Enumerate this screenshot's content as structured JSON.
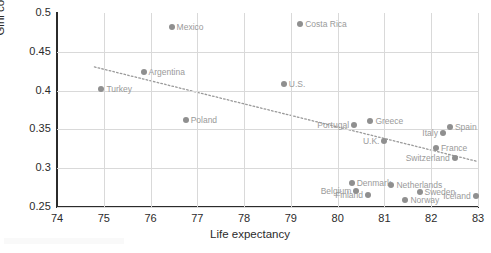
{
  "chart_data": {
    "type": "scatter",
    "title": "",
    "xlabel": "Life expectancy",
    "ylabel": "Gini coefficient",
    "xlim": [
      74,
      83
    ],
    "ylim": [
      0.25,
      0.5
    ],
    "xticks": [
      "74",
      "75",
      "76",
      "77",
      "78",
      "79",
      "80",
      "81",
      "82",
      "83"
    ],
    "yticks": [
      "0.25",
      "0.3",
      "0.35",
      "0.4",
      "0.45",
      "0.5"
    ],
    "grid": true,
    "legend": "none",
    "marker_color": "#8f8f8f",
    "label_color": "#9a9a9a",
    "axis_color": "#2b2b2b",
    "trendline": {
      "style": "dotted",
      "color": "#9a9a9a",
      "x_start": 74.8,
      "y_start": 0.4305,
      "x_end": 83.0,
      "y_end": 0.3085
    },
    "points": [
      {
        "name": "Turkey",
        "x": 74.95,
        "y": 0.4015,
        "label_side": "right"
      },
      {
        "name": "Argentina",
        "x": 75.85,
        "y": 0.4245,
        "label_side": "right"
      },
      {
        "name": "Mexico",
        "x": 76.45,
        "y": 0.4815,
        "label_side": "right"
      },
      {
        "name": "Poland",
        "x": 76.75,
        "y": 0.3615,
        "label_side": "right"
      },
      {
        "name": "U.S.",
        "x": 78.85,
        "y": 0.4085,
        "label_side": "right"
      },
      {
        "name": "Costa Rica",
        "x": 79.2,
        "y": 0.4855,
        "label_side": "right"
      },
      {
        "name": "Portugal",
        "x": 80.35,
        "y": 0.3555,
        "label_side": "left"
      },
      {
        "name": "Greece",
        "x": 80.7,
        "y": 0.3605,
        "label_side": "right"
      },
      {
        "name": "Belgium",
        "x": 80.4,
        "y": 0.2705,
        "label_side": "left"
      },
      {
        "name": "Denmark",
        "x": 80.3,
        "y": 0.2805,
        "label_side": "right"
      },
      {
        "name": "Finland",
        "x": 80.65,
        "y": 0.2655,
        "label_side": "left"
      },
      {
        "name": "U.K.",
        "x": 81.0,
        "y": 0.3355,
        "label_side": "left"
      },
      {
        "name": "Netherlands",
        "x": 81.15,
        "y": 0.2785,
        "label_side": "right"
      },
      {
        "name": "Norway",
        "x": 81.45,
        "y": 0.2585,
        "label_side": "right"
      },
      {
        "name": "Sweden",
        "x": 81.75,
        "y": 0.2695,
        "label_side": "right"
      },
      {
        "name": "Italy",
        "x": 82.25,
        "y": 0.3455,
        "label_side": "left"
      },
      {
        "name": "France",
        "x": 82.1,
        "y": 0.3255,
        "label_side": "right"
      },
      {
        "name": "Switzerland",
        "x": 82.5,
        "y": 0.3135,
        "label_side": "left"
      },
      {
        "name": "Spain",
        "x": 82.4,
        "y": 0.3525,
        "label_side": "right"
      },
      {
        "name": "Iceland",
        "x": 82.95,
        "y": 0.2645,
        "label_side": "left"
      }
    ]
  }
}
